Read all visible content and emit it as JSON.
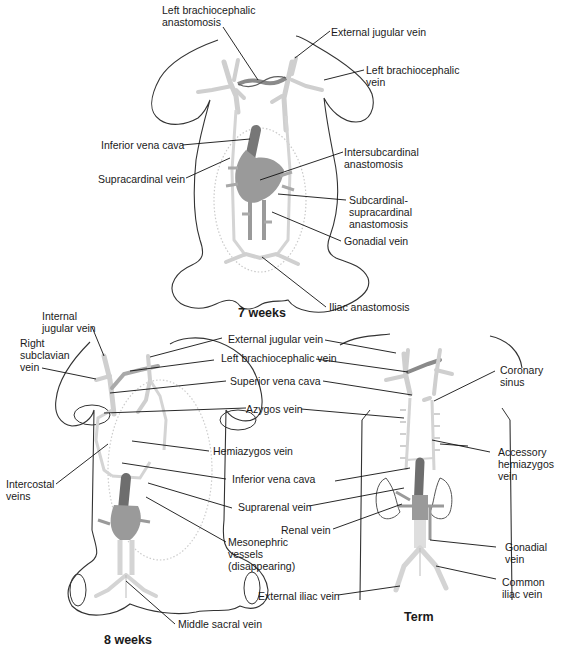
{
  "figure": {
    "colors": {
      "outline": "#333333",
      "vessel_light": "#d4d4d4",
      "vessel_mid": "#9a9a9a",
      "vessel_dark": "#6e6e6e",
      "leader": "#111111",
      "text": "#1a1a1a"
    }
  },
  "panels": {
    "week7": {
      "stage_label": "7 weeks",
      "labels": {
        "left_brachiocephalic_anastomosis": "Left brachiocephalic\nanastomosis",
        "external_jugular_vein": "External jugular vein",
        "left_brachiocephalic_vein": "Left brachiocephalic\nvein",
        "inferior_vena_cava": "Inferior vena cava",
        "intersubcardinal_anastomosis": "Intersubcardinal\nanastomosis",
        "supracardinal_vein": "Supracardinal vein",
        "subcardinal_supracardinal_anastomosis": "Subcardinal-\nsupracardinal\nanastomosis",
        "gonadial_vein": "Gonadial vein",
        "iliac_anastomosis": "Iliac anastomosis"
      }
    },
    "week8": {
      "stage_label": "8 weeks",
      "labels": {
        "internal_jugular_vein": "Internal\njugular vein",
        "right_subclavian_vein": "Right\nsubclavian\nvein",
        "intercostal_veins": "Intercostal\nveins",
        "mesonephric_vessels": "Mesonephric\nvessels\n(disappearing)",
        "middle_sacral_vein": "Middle sacral vein"
      }
    },
    "shared_center": {
      "labels": {
        "external_jugular_vein": "External jugular vein",
        "left_brachiocephalic_vein": "Left brachiocephalic vein",
        "superior_vena_cava": "Superior vena cava",
        "azygos_vein": "Azygos vein",
        "hemiazygos_vein": "Hemiazygos vein",
        "inferior_vena_cava": "Inferior vena cava",
        "suprarenal_vein": "Suprarenal vein",
        "renal_vein": "Renal vein",
        "external_iliac_vein": "External iliac vein"
      }
    },
    "term": {
      "stage_label": "Term",
      "labels": {
        "coronary_sinus": "Coronary\nsinus",
        "accessory_hemiazygos_vein": "Accessory\nhemiazygos\nvein",
        "gonadial_vein": "Gonadial\nvein",
        "common_iliac_vein": "Common\niliac vein"
      }
    }
  }
}
